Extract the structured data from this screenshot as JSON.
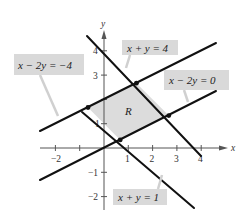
{
  "diagram": {
    "region_label": "R",
    "axes": {
      "x_label": "x",
      "y_label": "y",
      "x_ticks": [
        "−2",
        "1",
        "2",
        "3",
        "4"
      ],
      "y_ticks": [
        "4",
        "3",
        "1",
        "−1",
        "−2"
      ]
    },
    "lines": [
      {
        "id": "x+y=4",
        "label": "x + y = 4"
      },
      {
        "id": "x+y=1",
        "label": "x + y = 1"
      },
      {
        "id": "x-2y=-4",
        "label": "x − 2y = −4"
      },
      {
        "id": "x-2y=0",
        "label": "x − 2y = 0"
      }
    ],
    "colors": {
      "region_fill": "#dcdcdc",
      "label_box": "#d9d9d9",
      "line": "#111111",
      "axis": "#555555"
    }
  }
}
